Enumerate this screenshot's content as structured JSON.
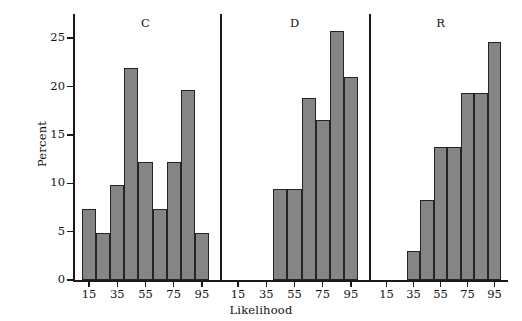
{
  "chart_data": {
    "type": "bar",
    "title": "",
    "xlabel": "Likelihood",
    "ylabel": "Percent",
    "ylim": [
      0,
      27.5
    ],
    "xlim": [
      5,
      105
    ],
    "grid": false,
    "legend": "none",
    "bin_width": 10,
    "panel_layout": "three side-by-side histogram panels sharing one Percent axis",
    "y_ticks": [
      0,
      5,
      10,
      15,
      20,
      25
    ],
    "x_ticks": [
      15,
      35,
      55,
      75,
      95
    ],
    "panels": [
      {
        "label": "C",
        "bin_centers": [
          15,
          25,
          35,
          45,
          55,
          65,
          75,
          85,
          95
        ],
        "values": [
          7.3,
          4.9,
          9.8,
          21.9,
          12.2,
          7.3,
          12.2,
          19.6,
          4.9
        ]
      },
      {
        "label": "D",
        "bin_centers": [
          45,
          55,
          65,
          75,
          85,
          95
        ],
        "values": [
          9.4,
          9.4,
          18.8,
          16.5,
          25.7,
          21.0
        ]
      },
      {
        "label": "R",
        "bin_centers": [
          35,
          45,
          55,
          65,
          75,
          85,
          95
        ],
        "values": [
          3.0,
          8.3,
          13.7,
          13.7,
          19.3,
          19.3,
          24.6
        ]
      }
    ],
    "colors": {
      "bar_fill": "#858585",
      "bar_edge": "#242424",
      "axis": "#1a1a1a",
      "text": "#111111",
      "background": "#ffffff"
    }
  }
}
